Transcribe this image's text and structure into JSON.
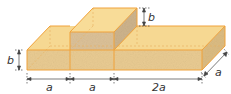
{
  "figure": {
    "colors": {
      "top_face": "#f6d892",
      "front_face": "#e9cb92",
      "side_face": "#d9b97e",
      "upper_side_face": "#cdb38c",
      "edge": "#f0a23a",
      "hidden_edge": "#e8b060",
      "dimension": "#444444"
    },
    "labels": {
      "bottom_left": "a",
      "bottom_middle": "a",
      "bottom_right": "2a",
      "depth": "a",
      "height_left": "b",
      "height_top": "b"
    }
  }
}
